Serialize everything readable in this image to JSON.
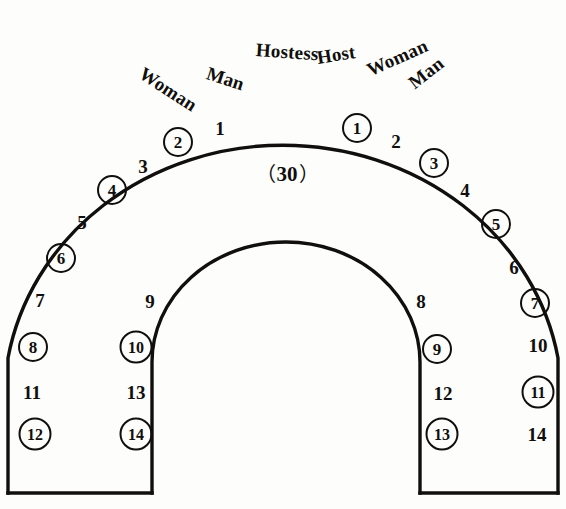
{
  "diagram": {
    "shape": "horseshoe",
    "capacity_label": "30",
    "paren_open": "（",
    "paren_close": "）",
    "stroke_color": "#100f0d",
    "background_color": "#fdfdfc"
  },
  "role_labels": [
    {
      "id": "woman-left",
      "text": "Woman",
      "x": 141,
      "y": 72,
      "rotate": -57
    },
    {
      "id": "man-left",
      "text": "Man",
      "x": 207,
      "y": 73,
      "rotate": -72
    },
    {
      "id": "hostess",
      "text": "Hostess",
      "x": 256,
      "y": 50,
      "rotate": -86
    },
    {
      "id": "host",
      "text": "Host",
      "x": 317,
      "y": 58,
      "rotate": -99
    },
    {
      "id": "woman-right",
      "text": "Woman",
      "x": 368,
      "y": 71,
      "rotate": -114
    },
    {
      "id": "man-right",
      "text": "Man",
      "x": 411,
      "y": 85,
      "rotate": -128
    }
  ],
  "seats": [
    {
      "id": "seat-right-1",
      "label": "1",
      "x": 357,
      "y": 128,
      "circled": true,
      "side": "right",
      "column": "outer"
    },
    {
      "id": "seat-right-2",
      "label": "2",
      "x": 396,
      "y": 141,
      "circled": false,
      "side": "right",
      "column": "inner"
    },
    {
      "id": "seat-right-3",
      "label": "3",
      "x": 434,
      "y": 163,
      "circled": true,
      "side": "right",
      "column": "outer"
    },
    {
      "id": "seat-right-4",
      "label": "4",
      "x": 465,
      "y": 190,
      "circled": false,
      "side": "right",
      "column": "inner"
    },
    {
      "id": "seat-right-5",
      "label": "5",
      "x": 496,
      "y": 224,
      "circled": true,
      "side": "right",
      "column": "outer"
    },
    {
      "id": "seat-right-6",
      "label": "6",
      "x": 514,
      "y": 267,
      "circled": false,
      "side": "right",
      "column": "inner"
    },
    {
      "id": "seat-right-7",
      "label": "7",
      "x": 535,
      "y": 303,
      "circled": true,
      "side": "right",
      "column": "outer"
    },
    {
      "id": "seat-right-8",
      "label": "8",
      "x": 421,
      "y": 301,
      "circled": false,
      "side": "right",
      "column": "inner"
    },
    {
      "id": "seat-right-9",
      "label": "9",
      "x": 437,
      "y": 349,
      "circled": true,
      "side": "right",
      "column": "inner"
    },
    {
      "id": "seat-right-10",
      "label": "10",
      "x": 538,
      "y": 345,
      "circled": false,
      "side": "right",
      "column": "outer"
    },
    {
      "id": "seat-right-11",
      "label": "11",
      "x": 538,
      "y": 392,
      "circled": true,
      "side": "right",
      "column": "outer"
    },
    {
      "id": "seat-right-12",
      "label": "12",
      "x": 443,
      "y": 393,
      "circled": false,
      "side": "right",
      "column": "inner"
    },
    {
      "id": "seat-right-13",
      "label": "13",
      "x": 442,
      "y": 434,
      "circled": true,
      "side": "right",
      "column": "inner"
    },
    {
      "id": "seat-right-14",
      "label": "14",
      "x": 537,
      "y": 434,
      "circled": false,
      "side": "right",
      "column": "outer"
    },
    {
      "id": "seat-left-1",
      "label": "1",
      "x": 220,
      "y": 128,
      "circled": false,
      "side": "left",
      "column": "inner"
    },
    {
      "id": "seat-left-2",
      "label": "2",
      "x": 178,
      "y": 142,
      "circled": true,
      "side": "left",
      "column": "outer"
    },
    {
      "id": "seat-left-3",
      "label": "3",
      "x": 143,
      "y": 166,
      "circled": false,
      "side": "left",
      "column": "inner"
    },
    {
      "id": "seat-left-4",
      "label": "4",
      "x": 112,
      "y": 190,
      "circled": true,
      "side": "left",
      "column": "outer"
    },
    {
      "id": "seat-left-5",
      "label": "5",
      "x": 82,
      "y": 222,
      "circled": false,
      "side": "left",
      "column": "inner"
    },
    {
      "id": "seat-left-6",
      "label": "6",
      "x": 61,
      "y": 258,
      "circled": true,
      "side": "left",
      "column": "outer"
    },
    {
      "id": "seat-left-7",
      "label": "7",
      "x": 40,
      "y": 300,
      "circled": false,
      "side": "left",
      "column": "inner"
    },
    {
      "id": "seat-left-8",
      "label": "8",
      "x": 33,
      "y": 347,
      "circled": true,
      "side": "left",
      "column": "outer"
    },
    {
      "id": "seat-left-9",
      "label": "9",
      "x": 150,
      "y": 301,
      "circled": false,
      "side": "left",
      "column": "inner"
    },
    {
      "id": "seat-left-10",
      "label": "10",
      "x": 136,
      "y": 347,
      "circled": true,
      "side": "left",
      "column": "inner"
    },
    {
      "id": "seat-left-11",
      "label": "11",
      "x": 32,
      "y": 392,
      "circled": false,
      "side": "left",
      "column": "outer"
    },
    {
      "id": "seat-left-12",
      "label": "12",
      "x": 35,
      "y": 434,
      "circled": true,
      "side": "left",
      "column": "outer"
    },
    {
      "id": "seat-left-13",
      "label": "13",
      "x": 136,
      "y": 392,
      "circled": false,
      "side": "left",
      "column": "inner"
    },
    {
      "id": "seat-left-14",
      "label": "14",
      "x": 136,
      "y": 434,
      "circled": true,
      "side": "left",
      "column": "inner"
    }
  ]
}
